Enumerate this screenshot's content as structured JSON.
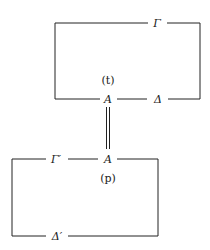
{
  "diagram": {
    "top_box": {
      "top_label": "Γ",
      "bottom_left_label": "A",
      "bottom_right_label": "Δ",
      "inner_label": "(t)"
    },
    "connector": {
      "type": "double-line",
      "meaning": "identity"
    },
    "bottom_box": {
      "top_left_label": "Γ′",
      "top_right_label": "A",
      "inner_label": "(p)",
      "bottom_label": "Δ′"
    },
    "colors": {
      "line": "#222222",
      "text": "#1a1a1a",
      "background": "#ffffff"
    }
  }
}
